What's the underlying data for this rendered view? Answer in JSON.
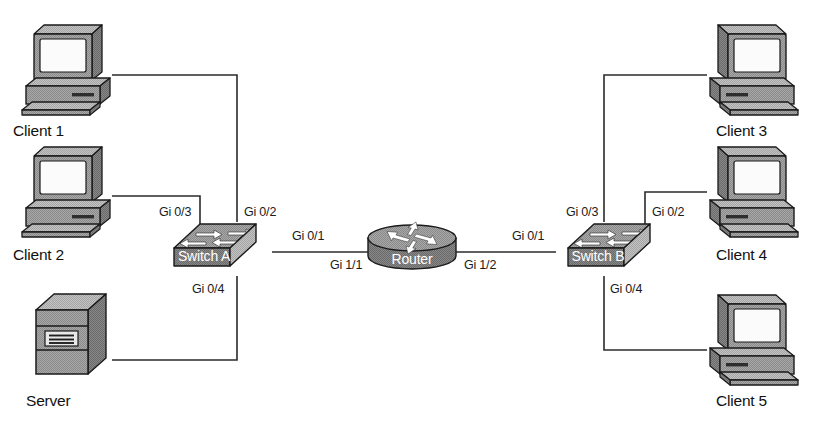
{
  "diagram": {
    "type": "network-topology",
    "canvas": {
      "width": 838,
      "height": 438
    },
    "colors": {
      "background": "#ffffff",
      "line": "#2b2b2b",
      "device_fill": "#9a9a9a",
      "device_fill_light": "#b8b8b8",
      "device_fill_dark": "#6e6e6e",
      "device_stroke": "#1a1a1a",
      "screen": "#fbfbfb",
      "device_text": "#ffffff",
      "label_text": "#111111"
    },
    "nodes": [
      {
        "id": "client1",
        "label": "Client 1",
        "kind": "pc",
        "x": 66,
        "y": 72,
        "label_x": 66,
        "label_y": 131
      },
      {
        "id": "client2",
        "label": "Client 2",
        "kind": "pc",
        "x": 66,
        "y": 196,
        "label_x": 66,
        "label_y": 256
      },
      {
        "id": "server",
        "label": "Server",
        "kind": "server",
        "x": 66,
        "y": 330,
        "label_x": 66,
        "label_y": 400
      },
      {
        "id": "switchA",
        "label": "Switch A",
        "kind": "switch",
        "x": 216,
        "y": 248,
        "label_x": 216,
        "label_y": 255
      },
      {
        "id": "router",
        "label": "Router",
        "kind": "router",
        "x": 412,
        "y": 250,
        "label_x": 412,
        "label_y": 262
      },
      {
        "id": "switchB",
        "label": "Switch B",
        "kind": "switch",
        "x": 610,
        "y": 248,
        "label_x": 610,
        "label_y": 255
      },
      {
        "id": "client3",
        "label": "Client 3",
        "kind": "pc",
        "x": 753,
        "y": 72,
        "label_x": 753,
        "label_y": 131
      },
      {
        "id": "client4",
        "label": "Client 4",
        "kind": "pc",
        "x": 753,
        "y": 196,
        "label_x": 753,
        "label_y": 256
      },
      {
        "id": "client5",
        "label": "Client 5",
        "kind": "pc",
        "x": 753,
        "y": 340,
        "label_x": 753,
        "label_y": 400
      }
    ],
    "links": [
      {
        "id": "link-client1-switchA",
        "from": "client1",
        "to": "switchA",
        "path": "M 112 75 L 237 75 L 237 222"
      },
      {
        "id": "link-client2-switchA",
        "from": "client2",
        "to": "switchA",
        "path": "M 112 196 L 200 196 L 200 228"
      },
      {
        "id": "link-server-switchA",
        "from": "server",
        "to": "switchA",
        "path": "M 112 360 L 237 360 L 237 276"
      },
      {
        "id": "link-switchA-router",
        "from": "switchA",
        "to": "router",
        "path": "M 272 252 L 368 252"
      },
      {
        "id": "link-router-switchB",
        "from": "router",
        "to": "switchB",
        "path": "M 456 252 L 556 252"
      },
      {
        "id": "link-switchB-client3",
        "from": "switchB",
        "to": "client3",
        "path": "M 604 222 L 604 75 L 707 75"
      },
      {
        "id": "link-switchB-client4",
        "from": "switchB",
        "to": "client4",
        "path": "M 645 228 L 645 192 L 707 192"
      },
      {
        "id": "link-switchB-client5",
        "from": "switchB",
        "to": "client5",
        "path": "M 604 276 L 604 350 L 707 350"
      }
    ],
    "port_labels": [
      {
        "id": "port-switchA-gi03",
        "text": "Gi 0/3",
        "device": "switchA",
        "x": 159,
        "y": 216,
        "anchor": "start"
      },
      {
        "id": "port-switchA-gi02",
        "text": "Gi 0/2",
        "device": "switchA",
        "x": 244,
        "y": 216,
        "anchor": "start"
      },
      {
        "id": "port-switchA-gi01",
        "text": "Gi 0/1",
        "device": "switchA",
        "x": 292,
        "y": 240,
        "anchor": "start"
      },
      {
        "id": "port-switchA-gi04",
        "text": "Gi 0/4",
        "device": "switchA",
        "x": 192,
        "y": 293,
        "anchor": "start"
      },
      {
        "id": "port-router-gi11",
        "text": "Gi 1/1",
        "device": "router",
        "x": 330,
        "y": 269,
        "anchor": "start"
      },
      {
        "id": "port-router-gi12",
        "text": "Gi 1/2",
        "device": "router",
        "x": 464,
        "y": 269,
        "anchor": "start"
      },
      {
        "id": "port-switchB-gi01",
        "text": "Gi 0/1",
        "device": "switchB",
        "x": 512,
        "y": 240,
        "anchor": "start"
      },
      {
        "id": "port-switchB-gi03",
        "text": "Gi 0/3",
        "device": "switchB",
        "x": 566,
        "y": 216,
        "anchor": "start"
      },
      {
        "id": "port-switchB-gi02",
        "text": "Gi 0/2",
        "device": "switchB",
        "x": 652,
        "y": 216,
        "anchor": "start"
      },
      {
        "id": "port-switchB-gi04",
        "text": "Gi 0/4",
        "device": "switchB",
        "x": 610,
        "y": 293,
        "anchor": "start"
      }
    ]
  }
}
